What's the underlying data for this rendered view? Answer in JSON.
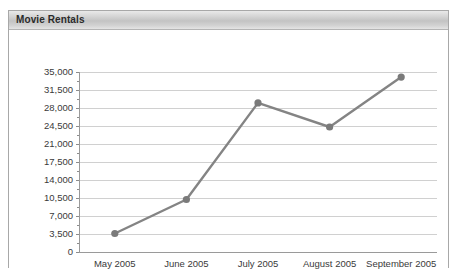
{
  "panel": {
    "title": "Movie Rentals"
  },
  "chart_data": {
    "type": "line",
    "title": "Movie Rentals",
    "xlabel": "",
    "ylabel": "",
    "categories": [
      "May 2005",
      "June 2005",
      "July 2005",
      "August 2005",
      "September 2005"
    ],
    "values": [
      3600,
      10200,
      29000,
      24300,
      34000
    ],
    "series": [
      {
        "name": "Movie Rentals",
        "values": [
          3600,
          10200,
          29000,
          24300,
          34000
        ]
      }
    ],
    "ylim": [
      0,
      35000
    ],
    "ytick_step": 3500,
    "ytick_labels": [
      "35,000",
      "31,500",
      "28,000",
      "24,500",
      "21,000",
      "17,500",
      "14,000",
      "10,500",
      "7,000",
      "3,500",
      "0"
    ],
    "ytick_values": [
      35000,
      31500,
      28000,
      24500,
      21000,
      17500,
      14000,
      10500,
      7000,
      3500,
      0
    ],
    "grid": true,
    "legend": false,
    "legend_position": "none",
    "line_color": "#848484",
    "marker_color": "#7a7a7a",
    "grid_color": "#d0d0d0",
    "axis_color": "#9a9a9a",
    "plot_background": "#ffffff"
  }
}
